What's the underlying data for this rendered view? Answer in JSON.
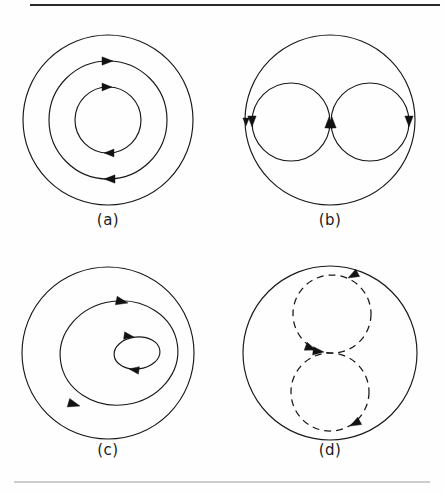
{
  "figure": {
    "background_color": "#fefefe",
    "line_color": "#181818",
    "caption_color": "#1a1a1a",
    "rules": {
      "top_rule_color": "#2a2a2a",
      "bottom_rule_color": "#9a9a9a"
    },
    "panels": [
      {
        "id": "a",
        "caption": "(a)",
        "caption_x": 108,
        "caption_y": 225,
        "center": {
          "x": 108,
          "y": 120
        },
        "description": "three concentric circles, counterclockwise flow arrows on inner and middle circles",
        "curves": [
          {
            "name": "outer-circle",
            "shape": "circle",
            "cx": 108,
            "cy": 120,
            "r": 85,
            "style": "solid",
            "direction": "none"
          },
          {
            "name": "middle-circle",
            "shape": "circle",
            "cx": 108,
            "cy": 120,
            "r": 59,
            "style": "solid",
            "direction": "counterclockwise"
          },
          {
            "name": "inner-circle",
            "shape": "circle",
            "cx": 108,
            "cy": 120,
            "r": 33,
            "style": "solid",
            "direction": "counterclockwise"
          }
        ],
        "arrows": [
          {
            "name": "middle-top-arrow",
            "x": 113,
            "y": 61,
            "angle": 180
          },
          {
            "name": "middle-bottom-arrow",
            "x": 104,
            "y": 179,
            "angle": 0
          },
          {
            "name": "inner-top-arrow",
            "x": 112,
            "y": 87,
            "angle": 180
          },
          {
            "name": "inner-bottom-arrow",
            "x": 104,
            "y": 153,
            "angle": 0
          }
        ]
      },
      {
        "id": "b",
        "caption": "(b)",
        "caption_x": 330,
        "caption_y": 225,
        "center": {
          "x": 330,
          "y": 120
        },
        "description": "large circle enclosing two side-by-side circles; left small circle clockwise, right small circle counterclockwise",
        "curves": [
          {
            "name": "outer-circle",
            "shape": "circle",
            "cx": 330,
            "cy": 120,
            "r": 85,
            "style": "solid",
            "direction": "clockwise"
          },
          {
            "name": "left-small-circle",
            "shape": "circle",
            "cx": 291,
            "cy": 122,
            "r": 39,
            "style": "solid",
            "direction": "clockwise"
          },
          {
            "name": "right-small-circle",
            "shape": "circle",
            "cx": 370,
            "cy": 122,
            "r": 39,
            "style": "solid",
            "direction": "counterclockwise"
          }
        ],
        "arrows": [
          {
            "name": "outer-left-arrow",
            "x": 246,
            "y": 122,
            "angle": 270
          },
          {
            "name": "left-circle-left-arrow",
            "x": 252,
            "y": 122,
            "angle": 270
          },
          {
            "name": "left-circle-right-arrow",
            "x": 330,
            "y": 122,
            "angle": 90
          },
          {
            "name": "right-circle-left-arrow",
            "x": 332,
            "y": 122,
            "angle": 90
          },
          {
            "name": "right-circle-right-arrow",
            "x": 409,
            "y": 122,
            "angle": 270
          }
        ]
      },
      {
        "id": "c",
        "caption": "(c)",
        "caption_x": 108,
        "caption_y": 455,
        "center": {
          "x": 108,
          "y": 353
        },
        "description": "outer circle, offset middle oval and small offset inner ellipse, all counterclockwise",
        "curves": [
          {
            "name": "outer-circle",
            "shape": "circle",
            "cx": 108,
            "cy": 353,
            "r": 86,
            "style": "solid",
            "direction": "none"
          },
          {
            "name": "middle-oval",
            "shape": "ellipse",
            "cx": 119,
            "cy": 353,
            "rx": 59,
            "ry": 52,
            "rotation": -8,
            "style": "solid",
            "direction": "counterclockwise"
          },
          {
            "name": "inner-ellipse",
            "shape": "ellipse",
            "cx": 137,
            "cy": 353,
            "rx": 23,
            "ry": 16,
            "rotation": -6,
            "style": "solid",
            "direction": "counterclockwise"
          }
        ],
        "arrows": [
          {
            "name": "middle-oval-top-arrow",
            "x": 128,
            "y": 303,
            "angle": 192
          },
          {
            "name": "middle-oval-bottom-arrow",
            "x": 92,
            "y": 404,
            "angle": 8
          },
          {
            "name": "inner-ellipse-top-arrow",
            "x": 135,
            "y": 337,
            "angle": 186
          },
          {
            "name": "inner-ellipse-bottom-arrow",
            "x": 130,
            "y": 369,
            "angle": 8
          }
        ]
      },
      {
        "id": "d",
        "caption": "(d)",
        "caption_x": 330,
        "caption_y": 455,
        "center": {
          "x": 330,
          "y": 353
        },
        "description": "large solid circle enclosing two vertically stacked dashed circles; upper dashed circle clockwise, lower dashed circle counterclockwise",
        "curves": [
          {
            "name": "outer-circle",
            "shape": "circle",
            "cx": 330,
            "cy": 353,
            "r": 87,
            "style": "solid",
            "direction": "none"
          },
          {
            "name": "upper-dashed-circle",
            "shape": "circle",
            "cx": 332,
            "cy": 314,
            "r": 39,
            "style": "dashed",
            "direction": "clockwise"
          },
          {
            "name": "lower-dashed-circle",
            "shape": "circle",
            "cx": 330,
            "cy": 392,
            "r": 39,
            "style": "dashed",
            "direction": "counterclockwise"
          }
        ],
        "arrows": [
          {
            "name": "upper-dashed-top-arrow",
            "x": 342,
            "y": 277,
            "angle": 352
          },
          {
            "name": "upper-dashed-bottom-arrow",
            "x": 322,
            "y": 352,
            "angle": 172
          },
          {
            "name": "lower-dashed-top-arrow",
            "x": 334,
            "y": 354,
            "angle": 184
          },
          {
            "name": "lower-dashed-bottom-arrow",
            "x": 343,
            "y": 429,
            "angle": 352
          }
        ]
      }
    ]
  }
}
